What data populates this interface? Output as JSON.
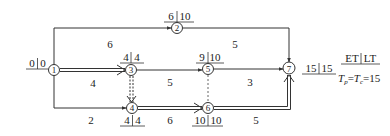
{
  "diagram": {
    "type": "double-code network (activity-on-arrow) with time parameters",
    "legend": {
      "header": "ET|LT",
      "header_et": "ET",
      "header_lt": "LT",
      "formula": "Tp=Tc=15"
    },
    "nodes": [
      {
        "id": "1",
        "et": "0",
        "lt": "0"
      },
      {
        "id": "2",
        "et": "6",
        "lt": "10"
      },
      {
        "id": "3",
        "et": "4",
        "lt": "4"
      },
      {
        "id": "4",
        "et": "4",
        "lt": "4"
      },
      {
        "id": "5",
        "et": "9",
        "lt": "10"
      },
      {
        "id": "6",
        "et": "10",
        "lt": "10"
      },
      {
        "id": "7",
        "et": "15",
        "lt": "15"
      }
    ],
    "activities": [
      {
        "from": "1",
        "to": "2",
        "duration": "6",
        "critical": false,
        "dummy": false
      },
      {
        "from": "2",
        "to": "7",
        "duration": "5",
        "critical": false,
        "dummy": false
      },
      {
        "from": "1",
        "to": "3",
        "duration": "4",
        "critical": true,
        "dummy": false
      },
      {
        "from": "3",
        "to": "5",
        "duration": "5",
        "critical": false,
        "dummy": false
      },
      {
        "from": "5",
        "to": "7",
        "duration": "3",
        "critical": false,
        "dummy": false
      },
      {
        "from": "1",
        "to": "4",
        "duration": "2",
        "critical": false,
        "dummy": false
      },
      {
        "from": "3",
        "to": "4",
        "duration": "",
        "critical": true,
        "dummy": true
      },
      {
        "from": "4",
        "to": "6",
        "duration": "6",
        "critical": true,
        "dummy": false
      },
      {
        "from": "5",
        "to": "6",
        "duration": "",
        "critical": false,
        "dummy": true
      },
      {
        "from": "6",
        "to": "7",
        "duration": "5",
        "critical": true,
        "dummy": false
      }
    ],
    "colors": {
      "line": "#333333",
      "text": "#222222",
      "background": "#ffffff"
    }
  }
}
